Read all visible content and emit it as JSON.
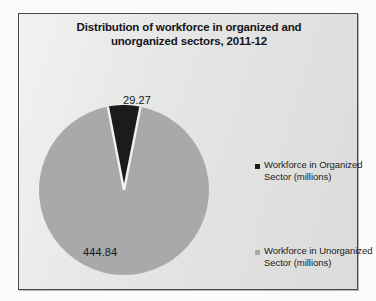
{
  "chart_data": {
    "type": "pie",
    "title": "Distribution of workforce in organized and unorganized sectors, 2011-12",
    "title_line1": "Distribution of workforce in organized and",
    "title_line2": "unorganized sectors, 2011-12",
    "unit": "millions",
    "categories": [
      "Workforce in Organized Sector (millions)",
      "Workforce in Unorganized Sector (millions)"
    ],
    "values": [
      29.27,
      444.84
    ],
    "labels": [
      "29.27",
      "444.84"
    ],
    "total": 474.11,
    "percentages": [
      6.17,
      93.83
    ],
    "colors": [
      "#1b1b1b",
      "#a9a9a9"
    ],
    "start_angle_deg": -11,
    "slice_separator_color": "#f2f2f2",
    "legend": {
      "position": "right",
      "entries": [
        {
          "label_line1": "Workforce in Organized",
          "label_line2": "Sector (millions)",
          "color": "#1b1b1b"
        },
        {
          "label_line1": "Workforce in Unorganized",
          "label_line2": "Sector (millions)",
          "color": "#a9a9a9"
        }
      ]
    },
    "grid": false,
    "xlabel": "",
    "ylabel": ""
  },
  "frame": {
    "background": "#e3e3e2",
    "border_color": "#4a4a4a"
  }
}
